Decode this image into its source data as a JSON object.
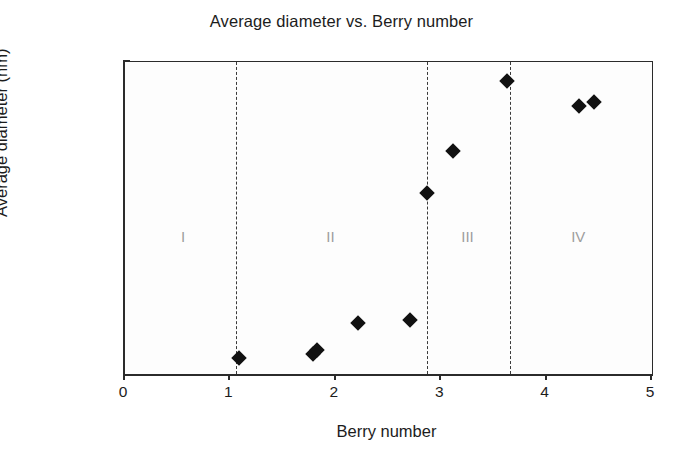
{
  "chart_data": {
    "type": "scatter",
    "title": "Average diameter vs. Berry number",
    "xlabel": "Berry number",
    "ylabel": "Average diameter (nm)",
    "xlim": [
      0,
      5
    ],
    "ylim": [
      0,
      3000
    ],
    "xticks": [
      "0",
      "1",
      "2",
      "3",
      "4",
      "5"
    ],
    "xtick_values": [
      0,
      1,
      2,
      3,
      4,
      5
    ],
    "yticks": [
      "0",
      "500",
      "1000",
      "1500",
      "2000",
      "2500",
      "3000"
    ],
    "ytick_values": [
      0,
      500,
      1000,
      1500,
      2000,
      2500,
      3000
    ],
    "grid": false,
    "legend": null,
    "marker": "diamond",
    "marker_color": "#111111",
    "points": [
      {
        "x": 1.08,
        "y": 155
      },
      {
        "x": 1.78,
        "y": 190
      },
      {
        "x": 1.82,
        "y": 230
      },
      {
        "x": 2.21,
        "y": 490
      },
      {
        "x": 2.7,
        "y": 520
      },
      {
        "x": 2.87,
        "y": 1745
      },
      {
        "x": 3.11,
        "y": 2140
      },
      {
        "x": 3.62,
        "y": 2815
      },
      {
        "x": 4.31,
        "y": 2580
      },
      {
        "x": 4.45,
        "y": 2620
      }
    ],
    "annotations": [
      {
        "label": "I",
        "x_center": 0.55,
        "y": 1400,
        "color": "#9d9d9d"
      },
      {
        "label": "II",
        "x_center": 1.95,
        "y": 1400,
        "color": "#9d9d9d"
      },
      {
        "label": "III",
        "x_center": 3.25,
        "y": 1400,
        "color": "#9d9d9d"
      },
      {
        "label": "IV",
        "x_center": 4.3,
        "y": 1400,
        "color": "#9d9d9d"
      }
    ],
    "dividers": [
      {
        "x": 1.05,
        "style": "dashed"
      },
      {
        "x": 2.87,
        "style": "dashed"
      },
      {
        "x": 3.65,
        "style": "dashed"
      }
    ]
  }
}
